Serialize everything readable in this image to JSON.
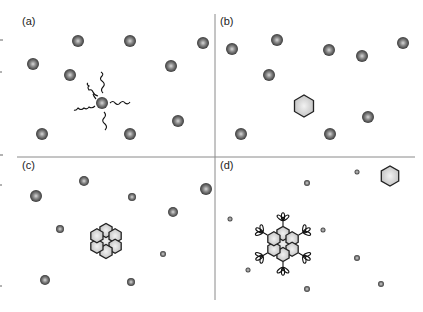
{
  "figure": {
    "panels": [
      {
        "id": "a",
        "label": "(a)",
        "label_pos": [
          22,
          25
        ],
        "description": "Dispersed spheres; one central sphere with attached wavy chains",
        "spheres": [
          [
            78,
            41,
            6
          ],
          [
            130,
            41,
            6
          ],
          [
            203,
            43,
            6
          ],
          [
            33,
            64,
            6
          ],
          [
            70,
            75,
            6
          ],
          [
            171,
            66,
            6
          ],
          [
            102,
            103,
            6
          ],
          [
            178,
            121,
            6
          ],
          [
            42,
            134,
            6
          ],
          [
            130,
            134,
            6
          ]
        ],
        "chain_center": [
          102,
          103
        ]
      },
      {
        "id": "b",
        "label": "(b)",
        "label_pos": [
          220,
          25
        ],
        "description": "Dispersed spheres with a single hexagonal particle",
        "spheres": [
          [
            277,
            40,
            6
          ],
          [
            232,
            49,
            6
          ],
          [
            329,
            50,
            6
          ],
          [
            362,
            56,
            6
          ],
          [
            403,
            43,
            6
          ],
          [
            269,
            75,
            6
          ],
          [
            368,
            117,
            6
          ],
          [
            241,
            134,
            6
          ],
          [
            330,
            134,
            6
          ]
        ],
        "hexagons": [
          [
            304,
            106,
            11
          ]
        ]
      },
      {
        "id": "c",
        "label": "(c)",
        "label_pos": [
          22,
          169
        ],
        "description": "Spheres of varied size around a hexagonal cluster (core + 6 hexagons)",
        "spheres": [
          [
            84,
            181,
            5
          ],
          [
            36,
            196,
            6
          ],
          [
            132,
            197,
            4
          ],
          [
            206,
            189,
            6
          ],
          [
            173,
            212,
            5
          ],
          [
            60,
            229,
            4
          ],
          [
            163,
            254,
            3
          ],
          [
            45,
            280,
            5
          ],
          [
            131,
            282,
            4
          ]
        ],
        "cluster": {
          "center": [
            106,
            241
          ],
          "type": "hexamer"
        }
      },
      {
        "id": "d",
        "label": "(d)",
        "label_pos": [
          220,
          169
        ],
        "description": "Small spheres, functionalized hexagonal cluster with branched ligands, and a separate hexagon",
        "spheres": [
          [
            307,
            183,
            3
          ],
          [
            357,
            172,
            2.5
          ],
          [
            230,
            219,
            2.5
          ],
          [
            323,
            230,
            2.5
          ],
          [
            357,
            258,
            3
          ],
          [
            248,
            270,
            2.5
          ],
          [
            307,
            289,
            3
          ],
          [
            381,
            284,
            3
          ]
        ],
        "hexagons": [
          [
            390,
            176,
            10
          ]
        ],
        "cluster": {
          "center": [
            283,
            244
          ],
          "type": "functionalized-hexamer"
        }
      }
    ],
    "dividers": {
      "horizontal": {
        "y": 157,
        "x1": 17,
        "x2": 415
      },
      "vertical": {
        "x": 215,
        "y1": 14,
        "y2": 300
      }
    },
    "colors": {
      "sphere_dark": "#3a3a3a",
      "sphere_mid": "#8a8a8a",
      "sphere_light": "#d8d8d8",
      "hexagon_fill": "#dcdcdc",
      "hexagon_stroke": "#222222",
      "line": "#8a8a8a"
    }
  }
}
